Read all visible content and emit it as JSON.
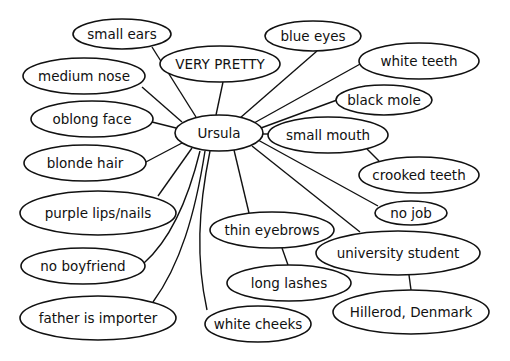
{
  "diagram": {
    "type": "mind-map",
    "center": {
      "id": "ursula",
      "label": "Ursula",
      "cx": 219,
      "cy": 133,
      "rx": 44,
      "ry": 18
    },
    "nodes": [
      {
        "id": "small-ears",
        "label": "small ears",
        "cx": 122,
        "cy": 34,
        "rx": 49,
        "ry": 15
      },
      {
        "id": "very-pretty",
        "label": "VERY PRETTY",
        "cx": 220,
        "cy": 64,
        "rx": 60,
        "ry": 18
      },
      {
        "id": "blue-eyes",
        "label": "blue eyes",
        "cx": 313,
        "cy": 36,
        "rx": 48,
        "ry": 15
      },
      {
        "id": "white-teeth",
        "label": "white teeth",
        "cx": 419,
        "cy": 61,
        "rx": 60,
        "ry": 18
      },
      {
        "id": "medium-nose",
        "label": "medium nose",
        "cx": 84,
        "cy": 76,
        "rx": 61,
        "ry": 18
      },
      {
        "id": "black-mole",
        "label": "black mole",
        "cx": 384,
        "cy": 100,
        "rx": 48,
        "ry": 15
      },
      {
        "id": "oblong-face",
        "label": "oblong face",
        "cx": 92,
        "cy": 119,
        "rx": 61,
        "ry": 18
      },
      {
        "id": "small-mouth",
        "label": "small mouth",
        "cx": 328,
        "cy": 135,
        "rx": 60,
        "ry": 18
      },
      {
        "id": "blonde-hair",
        "label": "blonde hair",
        "cx": 85,
        "cy": 163,
        "rx": 61,
        "ry": 18
      },
      {
        "id": "crooked-teeth",
        "label": "crooked teeth",
        "cx": 419,
        "cy": 175,
        "rx": 60,
        "ry": 18
      },
      {
        "id": "purple-lips-nails",
        "label": "purple lips/nails",
        "cx": 98,
        "cy": 213,
        "rx": 78,
        "ry": 22
      },
      {
        "id": "no-job",
        "label": "no job",
        "cx": 411,
        "cy": 213,
        "rx": 36,
        "ry": 12
      },
      {
        "id": "thin-eyebrows",
        "label": "thin eyebrows",
        "cx": 272,
        "cy": 230,
        "rx": 62,
        "ry": 18
      },
      {
        "id": "university-student",
        "label": "university student",
        "cx": 398,
        "cy": 253,
        "rx": 82,
        "ry": 22
      },
      {
        "id": "no-boyfriend",
        "label": "no boyfriend",
        "cx": 83,
        "cy": 266,
        "rx": 62,
        "ry": 18
      },
      {
        "id": "long-lashes",
        "label": "long lashes",
        "cx": 289,
        "cy": 283,
        "rx": 62,
        "ry": 18
      },
      {
        "id": "father-is-importer",
        "label": "father is importer",
        "cx": 98,
        "cy": 318,
        "rx": 78,
        "ry": 22
      },
      {
        "id": "white-cheeks",
        "label": "white cheeks",
        "cx": 258,
        "cy": 324,
        "rx": 53,
        "ry": 18
      },
      {
        "id": "hillerod-denmark",
        "label": "Hillerod, Denmark",
        "cx": 411,
        "cy": 312,
        "rx": 78,
        "ry": 22
      }
    ],
    "edges": [
      {
        "from": "ursula",
        "to": "small-ears",
        "path": "M196,117 L152,47"
      },
      {
        "from": "ursula",
        "to": "very-pretty",
        "path": "M216,115 L223,82"
      },
      {
        "from": "ursula",
        "to": "blue-eyes",
        "path": "M240,118 L317,51"
      },
      {
        "from": "ursula",
        "to": "white-teeth",
        "path": "M254,123 L362,63"
      },
      {
        "from": "ursula",
        "to": "medium-nose",
        "path": "M182,122 L142,87"
      },
      {
        "from": "ursula",
        "to": "black-mole",
        "path": "M261,128 L337,100"
      },
      {
        "from": "ursula",
        "to": "oblong-face",
        "path": "M176,128 L152,122"
      },
      {
        "from": "ursula",
        "to": "small-mouth",
        "path": "M263,134 L268,134"
      },
      {
        "from": "ursula",
        "to": "blonde-hair",
        "path": "M182,143 L144,163"
      },
      {
        "from": "ursula",
        "to": "purple-lips-nails",
        "path": "M192,148 L158,196"
      },
      {
        "from": "ursula",
        "to": "no-boyfriend",
        "path": "M200,151 C188,200 170,240 144,263"
      },
      {
        "from": "ursula",
        "to": "father-is-importer",
        "path": "M205,151 C195,215 180,265 153,302"
      },
      {
        "from": "ursula",
        "to": "white-cheeks",
        "path": "M210,151 C198,210 196,260 207,310"
      },
      {
        "from": "ursula",
        "to": "thin-eyebrows",
        "path": "M234,150 L249,213"
      },
      {
        "from": "ursula",
        "to": "university-student",
        "path": "M252,146 L360,232"
      },
      {
        "from": "ursula",
        "to": "no-job",
        "path": "M258,140 L378,206"
      },
      {
        "from": "small-mouth",
        "to": "crooked-teeth",
        "path": "M367,149 L379,161"
      },
      {
        "from": "thin-eyebrows",
        "to": "long-lashes",
        "path": "M282,248 L288,265"
      },
      {
        "from": "university-student",
        "to": "hillerod-denmark",
        "path": "M409,275 L411,290"
      }
    ]
  }
}
